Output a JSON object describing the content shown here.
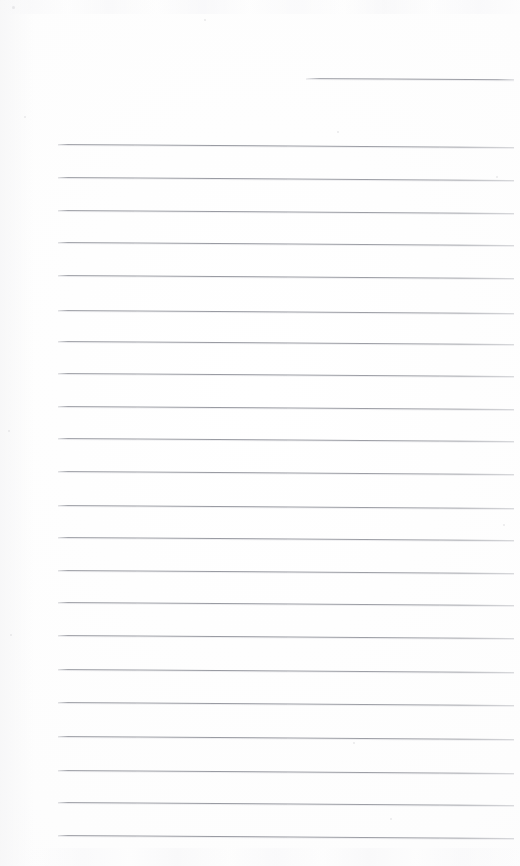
{
  "document": {
    "kind": "scanned-ruled-paper",
    "title": "Blank ruled notebook page",
    "width": 520,
    "height": 866,
    "has_text": false,
    "has_handwriting": false,
    "has_margin_rule": false,
    "orientation": "portrait"
  },
  "paper": {
    "background_color": "#fdfdfd",
    "edge_tone_color": "#f9f9fa",
    "gutter_shade_color": "#f6f6f7"
  },
  "ruling": {
    "line_color": "#96989f",
    "line_highlight_color": "#d6d7db",
    "line_thickness_px": 1,
    "line_spacing_px": 32.4,
    "left_margin_px": 58,
    "right_edge_px": 514,
    "skew_drop_px": 3,
    "full_line_count": 23,
    "partial_line_count": 1,
    "total_line_count": 24
  },
  "lines": [
    {
      "id": "rule-partial-1",
      "kind": "partial",
      "x": 306,
      "y": 78,
      "width": 208
    },
    {
      "id": "rule-1",
      "kind": "full",
      "x": 58,
      "y": 144,
      "width": 456
    },
    {
      "id": "rule-2",
      "kind": "full",
      "x": 58,
      "y": 177,
      "width": 456
    },
    {
      "id": "rule-3",
      "kind": "full",
      "x": 58,
      "y": 210,
      "width": 456
    },
    {
      "id": "rule-4",
      "kind": "full",
      "x": 58,
      "y": 242,
      "width": 456
    },
    {
      "id": "rule-5",
      "kind": "full",
      "x": 58,
      "y": 275,
      "width": 456
    },
    {
      "id": "rule-6",
      "kind": "full",
      "x": 58,
      "y": 310,
      "width": 456
    },
    {
      "id": "rule-7",
      "kind": "full",
      "x": 58,
      "y": 341,
      "width": 456
    },
    {
      "id": "rule-8",
      "kind": "full",
      "x": 58,
      "y": 373,
      "width": 456
    },
    {
      "id": "rule-9",
      "kind": "full",
      "x": 58,
      "y": 406,
      "width": 456
    },
    {
      "id": "rule-10",
      "kind": "full",
      "x": 58,
      "y": 438,
      "width": 456
    },
    {
      "id": "rule-11",
      "kind": "full",
      "x": 58,
      "y": 471,
      "width": 456
    },
    {
      "id": "rule-12",
      "kind": "full",
      "x": 58,
      "y": 505,
      "width": 456
    },
    {
      "id": "rule-13",
      "kind": "full",
      "x": 58,
      "y": 537,
      "width": 456
    },
    {
      "id": "rule-14",
      "kind": "full",
      "x": 58,
      "y": 570,
      "width": 456
    },
    {
      "id": "rule-15",
      "kind": "full",
      "x": 58,
      "y": 602,
      "width": 456
    },
    {
      "id": "rule-16",
      "kind": "full",
      "x": 58,
      "y": 635,
      "width": 456
    },
    {
      "id": "rule-17",
      "kind": "full",
      "x": 58,
      "y": 669,
      "width": 456
    },
    {
      "id": "rule-18",
      "kind": "full",
      "x": 58,
      "y": 702,
      "width": 456
    },
    {
      "id": "rule-19",
      "kind": "full",
      "x": 58,
      "y": 736,
      "width": 456
    },
    {
      "id": "rule-20",
      "kind": "full",
      "x": 58,
      "y": 770,
      "width": 456
    },
    {
      "id": "rule-21",
      "kind": "full",
      "x": 58,
      "y": 802,
      "width": 456
    },
    {
      "id": "rule-22",
      "kind": "full",
      "x": 58,
      "y": 835,
      "width": 456
    }
  ],
  "artifacts": {
    "ghost_top_label": "bleed-through-top",
    "ghost_bottom_label": "bleed-through-bottom",
    "specks": [
      {
        "x": 12,
        "y": 6,
        "size": 3
      },
      {
        "x": 24,
        "y": 116,
        "size": 2
      },
      {
        "x": 204,
        "y": 19,
        "size": 2
      },
      {
        "x": 337,
        "y": 131,
        "size": 2
      },
      {
        "x": 496,
        "y": 176,
        "size": 2
      },
      {
        "x": 8,
        "y": 430,
        "size": 2
      },
      {
        "x": 503,
        "y": 524,
        "size": 2
      },
      {
        "x": 10,
        "y": 634,
        "size": 2
      },
      {
        "x": 390,
        "y": 818,
        "size": 2
      },
      {
        "x": 353,
        "y": 742,
        "size": 2
      }
    ]
  }
}
